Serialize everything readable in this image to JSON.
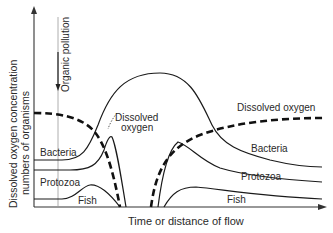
{
  "diagram": {
    "y_axis_label_line1": "Dissolved oxygen concentration",
    "y_axis_label_line2": "numbers of organisms",
    "x_axis_label": "Time or distance of flow",
    "pollution_label": "Organic pollution",
    "curves": {
      "dissolved_oxygen_left_label_line1": "Dissolved",
      "dissolved_oxygen_left_label_line2": "oxygen",
      "dissolved_oxygen_right_label": "Dissolved oxygen",
      "bacteria_left": "Bacteria",
      "bacteria_right": "Bacteria",
      "protozoa_left": "Protozoa",
      "protozoa_right": "Protozoa",
      "fish_left": "Fish",
      "fish_right": "Fish"
    },
    "colors": {
      "line": "#1a1a1a",
      "axis": "#333333",
      "pollution_line": "#888888"
    }
  }
}
